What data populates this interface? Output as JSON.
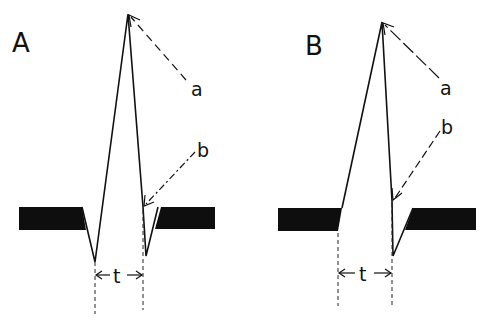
{
  "figure": {
    "colors": {
      "ink": "#111111",
      "background": "#ffffff"
    },
    "panels": [
      {
        "id": "A",
        "label": "A",
        "annotations": {
          "a": "a",
          "b": "b",
          "interval": "t"
        },
        "peak": [
          128,
          14
        ],
        "left_bar": {
          "x1": 19,
          "x2": 82,
          "y_top": 207,
          "y_bottom": 230
        },
        "trough_left": [
          95,
          262
        ],
        "b_point": [
          143,
          207
        ],
        "trough_right": [
          146,
          256
        ],
        "right_bar": {
          "x1": 158,
          "x2": 215,
          "y_top": 207,
          "y_bottom": 229
        },
        "t_left_x": 95,
        "t_right_x": 143
      },
      {
        "id": "B",
        "label": "B",
        "annotations": {
          "a": "a",
          "b": "b",
          "interval": "t"
        },
        "peak": [
          382,
          22
        ],
        "left_bar": {
          "x1": 278,
          "x2": 342,
          "y_top": 208,
          "y_bottom": 231
        },
        "b_point": [
          392,
          201
        ],
        "trough_right": [
          393,
          256
        ],
        "right_bar": {
          "x1": 413,
          "x2": 476,
          "y_top": 208,
          "y_bottom": 230
        },
        "t_left_x": 338,
        "t_right_x": 392
      }
    ]
  }
}
